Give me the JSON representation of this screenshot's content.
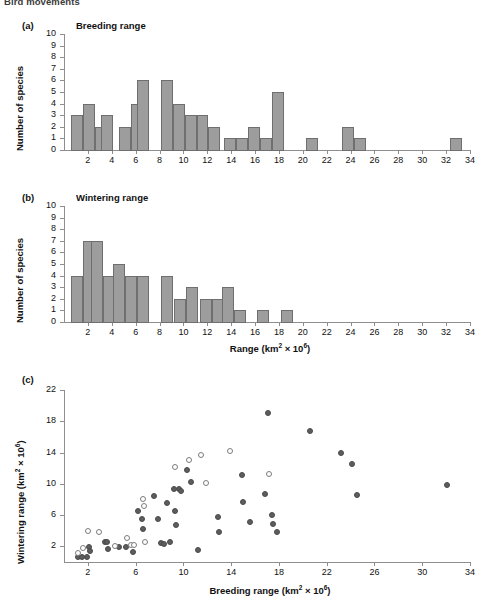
{
  "header": {
    "running_title": "Bird movements"
  },
  "figure": {
    "panels": [
      {
        "letter": "(a)",
        "title": "Breeding range"
      },
      {
        "letter": "(b)",
        "title": "Wintering range"
      },
      {
        "letter": "(c)",
        "title": ""
      }
    ]
  },
  "axis_labels": {
    "y_species": "Number of species",
    "x_range": "Range (km² × 10⁶)",
    "y_wintering": "Wintering range (km² × 10⁶)",
    "x_breeding": "Breeding range (km² × 10⁶)"
  },
  "chart_data": [
    {
      "type": "bar",
      "panel": "(a)",
      "title": "Breeding range",
      "xlabel": "",
      "ylabel": "Number of species",
      "xlim": [
        0,
        34
      ],
      "ylim": [
        0,
        10
      ],
      "bin_width": 1,
      "grid": false,
      "legend": null,
      "x_ticks": [
        2,
        4,
        6,
        8,
        10,
        12,
        14,
        16,
        18,
        20,
        22,
        24,
        26,
        28,
        30,
        32,
        34
      ],
      "y_ticks": [
        0,
        1,
        2,
        3,
        4,
        5,
        6,
        7,
        8,
        9,
        10
      ],
      "bin_starts": [
        0.6,
        1.6,
        2.6,
        3.1,
        4.6,
        5.6,
        6.1,
        8.1,
        9.1,
        10.1,
        11.1,
        12.1,
        13.4,
        14.4,
        15.4,
        16.4,
        17.4,
        20.3,
        23.3,
        24.3,
        32.3
      ],
      "categories": [
        "1",
        "2",
        "3",
        "4",
        "5",
        "6",
        "7",
        "8.5",
        "9.5",
        "10.5",
        "11.5",
        "12.5",
        "14",
        "15",
        "15.5",
        "17",
        "18",
        "20.5",
        "23.5",
        "24.5",
        "32.5"
      ],
      "values": [
        3,
        4,
        2,
        3,
        2,
        4,
        6,
        6,
        4,
        3,
        3,
        2,
        1,
        1,
        2,
        1,
        5,
        1,
        2,
        1,
        1
      ]
    },
    {
      "type": "bar",
      "panel": "(b)",
      "title": "Wintering range",
      "xlabel": "Range (km² × 10⁶)",
      "ylabel": "Number of species",
      "xlim": [
        0,
        34
      ],
      "ylim": [
        0,
        10
      ],
      "bin_width": 1,
      "grid": false,
      "legend": null,
      "x_ticks": [
        2,
        4,
        6,
        8,
        10,
        12,
        14,
        16,
        18,
        20,
        22,
        24,
        26,
        28,
        30,
        32,
        34
      ],
      "y_ticks": [
        0,
        1,
        2,
        3,
        4,
        5,
        6,
        7,
        8,
        9,
        10
      ],
      "bin_starts": [
        0.6,
        1.6,
        2.3,
        3.3,
        4.1,
        5.1,
        6.1,
        8.1,
        9.2,
        10.2,
        11.4,
        12.4,
        13.2,
        14.2,
        16.2,
        18.2
      ],
      "categories": [
        "1",
        "2",
        "2.8",
        "3.8",
        "4.6",
        "5.6",
        "6.6",
        "8.6",
        "9.7",
        "10.7",
        "11.9",
        "12.9",
        "13.7",
        "14.7",
        "16.7",
        "18.7"
      ],
      "values": [
        4,
        7,
        7,
        4,
        5,
        4,
        4,
        4,
        2,
        3,
        2,
        2,
        3,
        1,
        1,
        1
      ]
    },
    {
      "type": "scatter",
      "panel": "(c)",
      "title": "",
      "xlabel": "Breeding range (km² × 10⁶)",
      "ylabel": "Wintering range (km² × 10⁶)",
      "xlim": [
        0,
        34
      ],
      "ylim": [
        0,
        22
      ],
      "grid": false,
      "legend": null,
      "x_ticks": [
        2,
        6,
        10,
        14,
        18,
        22,
        26,
        30,
        34
      ],
      "y_ticks": [
        2,
        6,
        10,
        14,
        18,
        22
      ],
      "series": [
        {
          "name": "filled",
          "marker": "filled-circle",
          "points": [
            [
              1.2,
              0.6
            ],
            [
              1.5,
              0.6
            ],
            [
              1.9,
              0.7
            ],
            [
              2.1,
              1.9
            ],
            [
              2.2,
              1.4
            ],
            [
              3.4,
              2.5
            ],
            [
              3.6,
              2.6
            ],
            [
              3.7,
              1.7
            ],
            [
              4.6,
              1.9
            ],
            [
              5.2,
              1.9
            ],
            [
              5.8,
              1.3
            ],
            [
              6.2,
              6.5
            ],
            [
              6.5,
              5.5
            ],
            [
              6.6,
              4.2
            ],
            [
              7.5,
              8.5
            ],
            [
              7.9,
              5.5
            ],
            [
              8.1,
              2.4
            ],
            [
              8.4,
              2.3
            ],
            [
              8.6,
              7.6
            ],
            [
              8.9,
              2.5
            ],
            [
              9.2,
              9.4
            ],
            [
              9.3,
              6.5
            ],
            [
              9.4,
              4.7
            ],
            [
              9.6,
              9.4
            ],
            [
              9.8,
              9.1
            ],
            [
              10.3,
              11.8
            ],
            [
              10.6,
              10.2
            ],
            [
              11.2,
              1.5
            ],
            [
              12.9,
              5.7
            ],
            [
              13.0,
              3.8
            ],
            [
              14.9,
              11.1
            ],
            [
              15.0,
              7.7
            ],
            [
              15.6,
              5.1
            ],
            [
              16.8,
              8.7
            ],
            [
              17.1,
              19.0
            ],
            [
              17.4,
              6.0
            ],
            [
              17.5,
              4.8
            ],
            [
              17.8,
              3.8
            ],
            [
              20.6,
              16.7
            ],
            [
              23.2,
              14.0
            ],
            [
              24.1,
              12.5
            ],
            [
              24.5,
              8.6
            ],
            [
              32.1,
              9.9
            ]
          ]
        },
        {
          "name": "open",
          "marker": "open-circle",
          "points": [
            [
              1.2,
              1.1
            ],
            [
              1.6,
              1.8
            ],
            [
              2.0,
              4.0
            ],
            [
              2.9,
              3.8
            ],
            [
              4.3,
              2.1
            ],
            [
              5.3,
              3.1
            ],
            [
              5.6,
              2.2
            ],
            [
              5.9,
              2.2
            ],
            [
              6.6,
              8.0
            ],
            [
              6.7,
              7.1
            ],
            [
              6.8,
              2.6
            ],
            [
              9.3,
              12.1
            ],
            [
              10.5,
              13.0
            ],
            [
              11.5,
              13.7
            ],
            [
              11.9,
              10.1
            ],
            [
              13.9,
              14.2
            ],
            [
              17.2,
              11.2
            ]
          ]
        }
      ]
    }
  ]
}
